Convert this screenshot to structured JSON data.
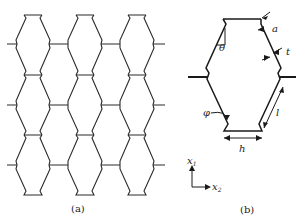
{
  "figure": {
    "panel_a": {
      "caption": "(a)",
      "description": "Periodic lattice of re-entrant hexagonal cells with notched vertices"
    },
    "panel_b": {
      "caption": "(b)",
      "description": "Unit cell with geometric parameters",
      "labels": {
        "theta": "θ",
        "a": "a",
        "t": "t",
        "phi": "φ",
        "l": "l",
        "h": "h"
      },
      "axes": {
        "x1": "x",
        "x1_sub": "1",
        "x2": "x",
        "x2_sub": "2"
      }
    }
  },
  "colors": {
    "stroke": "#2a2a2a",
    "background": "#ffffff"
  }
}
